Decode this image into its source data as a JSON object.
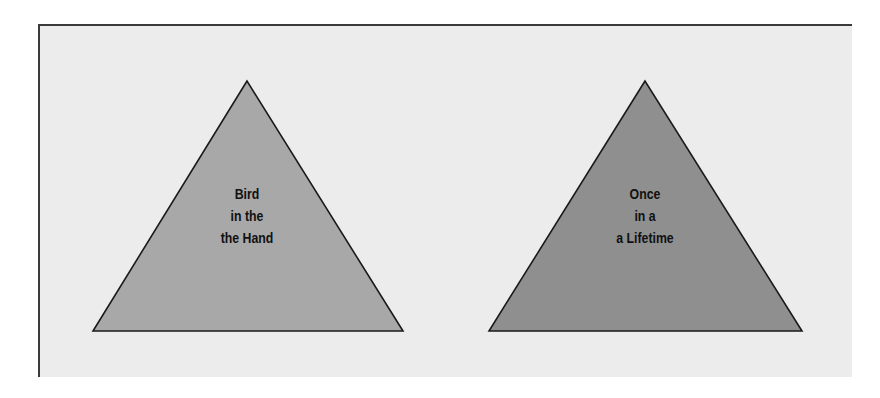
{
  "colors": {
    "background": "#ffffff",
    "panel": "#ececec",
    "panel_border": "#3a3a3a",
    "triangle_left_fill": "#a8a8a8",
    "triangle_right_fill": "#8f8f8f",
    "triangle_stroke": "#1a1a1a",
    "text": "#111111"
  },
  "triangles": [
    {
      "id": "bird-in-the-hand",
      "lines": [
        "Bird",
        "in the",
        "the Hand"
      ],
      "points": "247,81 93,331 403,331"
    },
    {
      "id": "once-in-a-lifetime",
      "lines": [
        "Once",
        "in a",
        "a Lifetime"
      ],
      "points": "645,81 489,331 802,331"
    }
  ]
}
